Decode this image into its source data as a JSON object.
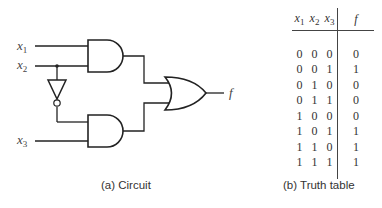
{
  "circuit": {
    "inputs": [
      {
        "var": "x",
        "sub": "1"
      },
      {
        "var": "x",
        "sub": "2"
      },
      {
        "var": "x",
        "sub": "3"
      }
    ],
    "output": "f",
    "gates": [
      "AND",
      "AND",
      "NOT",
      "OR"
    ],
    "caption": "(a) Circuit"
  },
  "truth_table": {
    "headers": [
      {
        "var": "x",
        "sub": "1"
      },
      {
        "var": "x",
        "sub": "2"
      },
      {
        "var": "x",
        "sub": "3"
      },
      {
        "var": "f",
        "sub": ""
      }
    ],
    "rows": [
      [
        "0",
        "0",
        "0",
        "0"
      ],
      [
        "0",
        "0",
        "1",
        "1"
      ],
      [
        "0",
        "1",
        "0",
        "0"
      ],
      [
        "0",
        "1",
        "1",
        "0"
      ],
      [
        "1",
        "0",
        "0",
        "0"
      ],
      [
        "1",
        "0",
        "1",
        "1"
      ],
      [
        "1",
        "1",
        "0",
        "1"
      ],
      [
        "1",
        "1",
        "1",
        "1"
      ]
    ],
    "caption": "(b) Truth table"
  },
  "colors": {
    "stroke": "#222222",
    "text": "#333333"
  }
}
